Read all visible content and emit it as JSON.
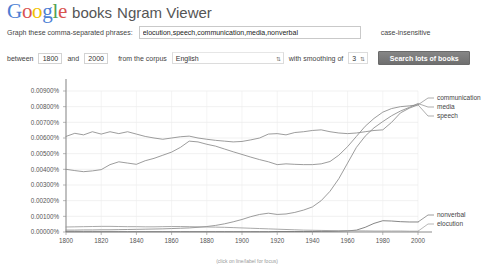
{
  "header": {
    "logo_letters": [
      "G",
      "o",
      "o",
      "g",
      "l",
      "e"
    ],
    "logo_text": "Google",
    "books_label": "books",
    "viewer_title": "Ngram Viewer"
  },
  "form": {
    "phrases_label": "Graph these comma-separated phrases:",
    "phrases_value": "elocution,speech,communication,media,nonverbal",
    "phrases_placeholder": "",
    "case_label": "case-insensitive",
    "between_label": "between",
    "year_start": "1800",
    "and_label": "and",
    "year_end": "2000",
    "corpus_label": "from the corpus",
    "corpus_value": "English",
    "smoothing_label": "with smoothing of",
    "smoothing_value": "3",
    "search_button": "Search lots of books",
    "dropdown_icon": "chevron-updown-icon"
  },
  "chart_data": {
    "type": "line",
    "title": "",
    "xlabel": "",
    "ylabel": "",
    "footnote": "(click on line/label for focus)",
    "grid": true,
    "legend_position": "right",
    "xlim": [
      1800,
      2000
    ],
    "ylim": [
      0.0,
      0.009
    ],
    "xticks": [
      "1800",
      "1820",
      "1840",
      "1860",
      "1880",
      "1900",
      "1920",
      "1940",
      "1960",
      "1980",
      "2000"
    ],
    "yticks": [
      "0.00000%",
      "0.00100%",
      "0.00200%",
      "0.00300%",
      "0.00400%",
      "0.00500%",
      "0.00600%",
      "0.00700%",
      "0.00800%",
      "0.00900%"
    ],
    "x": [
      1800,
      1805,
      1810,
      1815,
      1820,
      1825,
      1830,
      1835,
      1840,
      1845,
      1850,
      1855,
      1860,
      1865,
      1870,
      1875,
      1880,
      1885,
      1890,
      1895,
      1900,
      1905,
      1910,
      1915,
      1920,
      1925,
      1930,
      1935,
      1940,
      1945,
      1950,
      1955,
      1960,
      1965,
      1970,
      1975,
      1980,
      1985,
      1990,
      1995,
      2000
    ],
    "series": [
      {
        "name": "speech",
        "color": "#8a8a8a",
        "legend_order": 3,
        "values": [
          0.0061,
          0.0063,
          0.0062,
          0.0064,
          0.00625,
          0.0064,
          0.00628,
          0.0064,
          0.00625,
          0.0061,
          0.006,
          0.00592,
          0.006,
          0.00608,
          0.00612,
          0.006,
          0.00592,
          0.00585,
          0.0058,
          0.00575,
          0.00578,
          0.00588,
          0.006,
          0.00625,
          0.00628,
          0.0062,
          0.00635,
          0.0064,
          0.00648,
          0.00652,
          0.0064,
          0.00632,
          0.00628,
          0.00632,
          0.0064,
          0.00648,
          0.00652,
          0.007,
          0.0076,
          0.0079,
          0.00812
        ]
      },
      {
        "name": "communication",
        "color": "#8a8a8a",
        "legend_order": 1,
        "values": [
          0.004,
          0.00392,
          0.00385,
          0.0039,
          0.00398,
          0.0043,
          0.00448,
          0.0044,
          0.00432,
          0.00455,
          0.0047,
          0.0049,
          0.0051,
          0.0054,
          0.0058,
          0.00575,
          0.0056,
          0.00548,
          0.0053,
          0.00512,
          0.00495,
          0.00478,
          0.00462,
          0.00448,
          0.0043,
          0.00435,
          0.00432,
          0.0043,
          0.0043,
          0.00435,
          0.0045,
          0.0049,
          0.00545,
          0.0061,
          0.00675,
          0.00725,
          0.00765,
          0.00788,
          0.008,
          0.00805,
          0.00812
        ]
      },
      {
        "name": "media",
        "color": "#8a8a8a",
        "legend_order": 2,
        "values": [
          0.00012,
          0.00012,
          0.00013,
          0.00013,
          0.00014,
          0.00014,
          0.00015,
          0.00016,
          0.00017,
          0.00018,
          0.00019,
          0.0002,
          0.00022,
          0.00024,
          0.00026,
          0.0003,
          0.00035,
          0.00042,
          0.00052,
          0.00065,
          0.0008,
          0.00098,
          0.00112,
          0.0012,
          0.00112,
          0.00115,
          0.00125,
          0.0014,
          0.0016,
          0.002,
          0.0026,
          0.0034,
          0.0044,
          0.0054,
          0.00612,
          0.00665,
          0.00705,
          0.00742,
          0.00772,
          0.00795,
          0.0082
        ]
      },
      {
        "name": "nonverbal",
        "color": "#707070",
        "legend_order": 4,
        "values": [
          2e-05,
          2e-05,
          2e-05,
          2e-05,
          2e-05,
          2e-05,
          2e-05,
          2e-05,
          2e-05,
          2e-05,
          2e-05,
          2e-05,
          2e-05,
          2e-05,
          2e-05,
          2e-05,
          2e-05,
          2e-05,
          2e-05,
          2e-05,
          2e-05,
          2e-05,
          2e-05,
          2e-05,
          3e-05,
          3e-05,
          3e-05,
          3e-05,
          3e-05,
          4e-05,
          4e-05,
          5e-05,
          7e-05,
          0.00012,
          0.0003,
          0.00055,
          0.00072,
          0.0007,
          0.00066,
          0.00064,
          0.00064
        ]
      },
      {
        "name": "elocution",
        "color": "#9a9a9a",
        "legend_order": 5,
        "values": [
          0.00032,
          0.00033,
          0.00034,
          0.00035,
          0.00036,
          0.00036,
          0.00035,
          0.00034,
          0.00034,
          0.00033,
          0.00033,
          0.00034,
          0.00035,
          0.00035,
          0.00034,
          0.00033,
          0.00032,
          0.00031,
          0.0003,
          0.00028,
          0.00026,
          0.00024,
          0.00022,
          0.0002,
          0.00018,
          0.00016,
          0.00014,
          0.00012,
          0.00011,
          0.0001,
          9e-05,
          8e-05,
          8e-05,
          7e-05,
          7e-05,
          6e-05,
          6e-05,
          6e-05,
          6e-05,
          5e-05,
          5e-05
        ]
      }
    ],
    "legend_top": [
      "communication",
      "media",
      "speech"
    ],
    "legend_bottom": [
      "nonverbal",
      "elocution"
    ]
  }
}
